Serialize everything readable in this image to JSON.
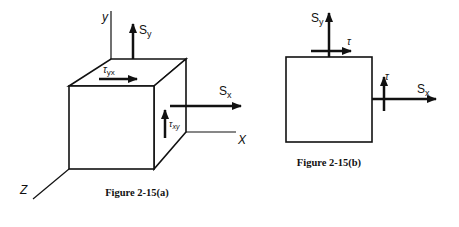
{
  "figure_a": {
    "caption": "Figure 2-15(a)",
    "axis_labels": {
      "y": "y",
      "x": "X",
      "z": "Z"
    },
    "stress_labels": {
      "sy": {
        "main": "S",
        "sub": "y"
      },
      "sx": {
        "main": "S",
        "sub": "x"
      },
      "tau_yx": {
        "main": "τ",
        "sub": "yx"
      },
      "tau_xy": {
        "main": "τ",
        "sub": "xy"
      }
    }
  },
  "figure_b": {
    "caption": "Figure 2-15(b)",
    "stress_labels": {
      "sy": {
        "main": "S",
        "sub": "y"
      },
      "sx": {
        "main": "S",
        "sub": "x"
      },
      "tau_top": "τ",
      "tau_right": "τ"
    }
  },
  "colors": {
    "stroke": "#111111",
    "background": "#ffffff"
  }
}
